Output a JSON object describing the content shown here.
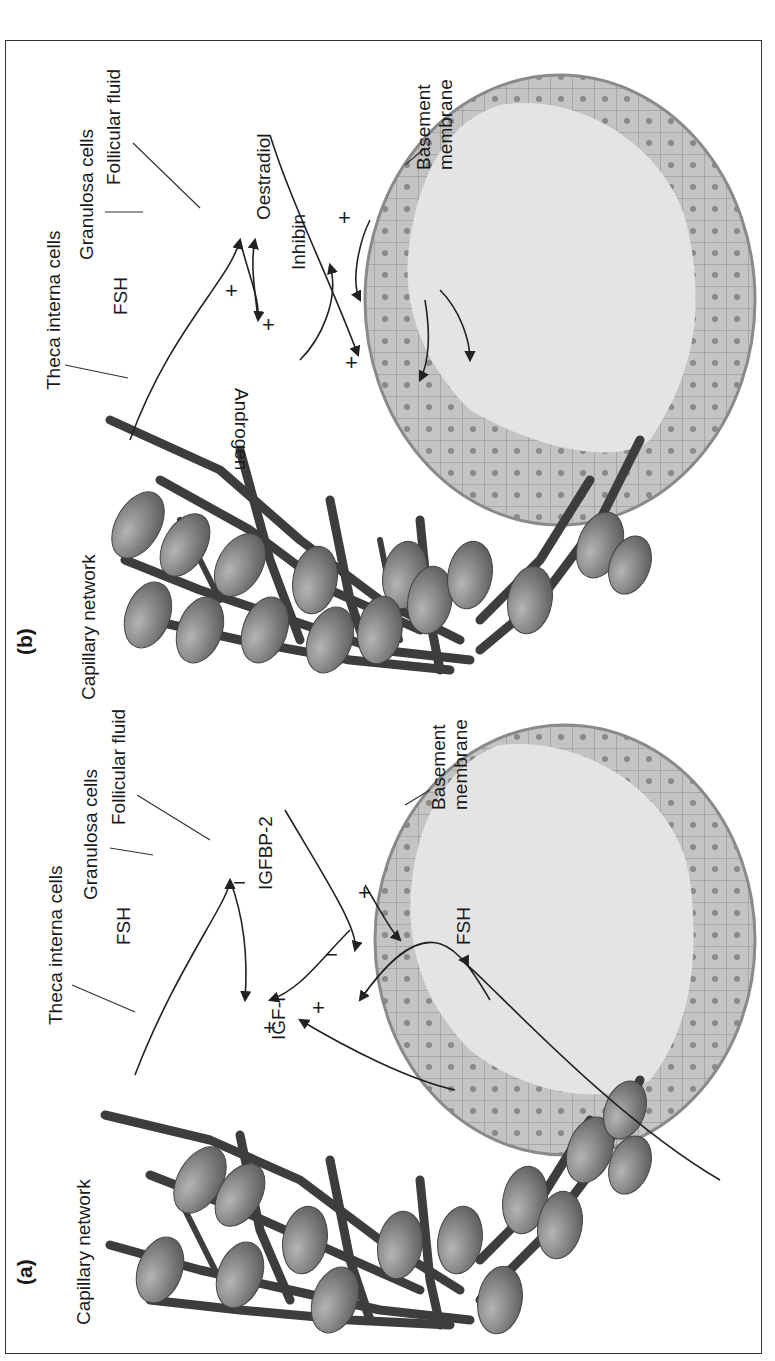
{
  "figure": {
    "orientation": "rotated 90° counter-clockwise",
    "panel_a": {
      "label": "(a)",
      "labels": {
        "capillary_network": "Capillary network",
        "theca_interna_cells": "Theca interna cells",
        "fsh_top": "FSH",
        "granulosa_cells": "Granulosa cells",
        "follicular_fluid": "Follicular fluid",
        "igfbp2": "IGFBP-2",
        "igf1": "IGF-I",
        "basement_membrane_line1": "Basement",
        "basement_membrane_line2": "membrane",
        "fsh_bottom": "FSH"
      },
      "signs": [
        "−",
        "+",
        "+",
        "−",
        "+"
      ]
    },
    "panel_b": {
      "label": "(b)",
      "labels": {
        "capillary_network": "Capillary network",
        "theca_interna_cells": "Theca interna cells",
        "fsh": "FSH",
        "granulosa_cells": "Granulosa cells",
        "follicular_fluid": "Follicular fluid",
        "oestradiol": "Oestradiol",
        "inhibin": "Inhibin",
        "androgen": "Androgen",
        "basement_membrane_line1": "Basement",
        "basement_membrane_line2": "membrane"
      },
      "signs": [
        "+",
        "+",
        "+",
        "+"
      ]
    },
    "colors": {
      "granulosa_layer": "#bdbdbd",
      "follicular_fluid": "#e4e4e4",
      "cell_nucleus": "#8a8a8a",
      "theca_cell": "#7a7a7a",
      "capillary": "#3d3d3d",
      "frame": "#333333"
    }
  }
}
